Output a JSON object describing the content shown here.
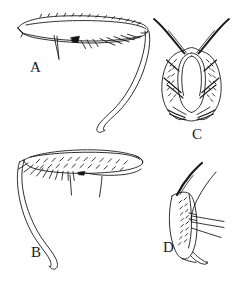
{
  "figure": {
    "background_color": "#ffffff",
    "ink_color": "#1a1a1a",
    "panel_count": 4
  },
  "panels": [
    {
      "id": "A",
      "label": "A",
      "label_x": 30,
      "label_y": 60,
      "description": "Elongate tapering lobe in lateral view with marginal bristle row along dorsal edge, a solid black triangular sclerite on the ventral margin, a row of short setae to its right, and a long slender rod-like appendage descending to the lower right and ending in a rounded club.",
      "orientation": "bristles on right, appendage descends to lower right"
    },
    {
      "id": "B",
      "label": "B",
      "label_x": 31,
      "label_y": 245,
      "description": "Mirror image of A. Elongate lobe densely covered with fine oblique hairs, a comb of longer bristles along the left ventral margin, a small dark sclerite near the middle, two fine setae below, and a long slender rod-like appendage descending to the lower left ending in a rounded club.",
      "orientation": "bristles on left, appendage descends to lower left"
    },
    {
      "id": "C",
      "label": "C",
      "label_x": 192,
      "label_y": 127,
      "description": "Bilaterally symmetric bilobed structure in dorsal view enclosing a central oval cavity. Each lobe is finely pubescent and bears two long stout curved setae arising from the apex and directed outward, plus several inward-pointing setae and a pair of short apical spines at the base.",
      "orientation": "symmetric, setae directed up and outward"
    },
    {
      "id": "D",
      "label": "D",
      "label_x": 163,
      "label_y": 240,
      "description": "Single lobe in lateral view, finely pubescent along its inner face, bearing one thick black seta emerging from the apex and curving up and to the right, three long fine setae extending to the right from the mid-region, and a pointed hooked process at the ventral tip.",
      "orientation": "apex up, hooked tip at bottom"
    }
  ]
}
